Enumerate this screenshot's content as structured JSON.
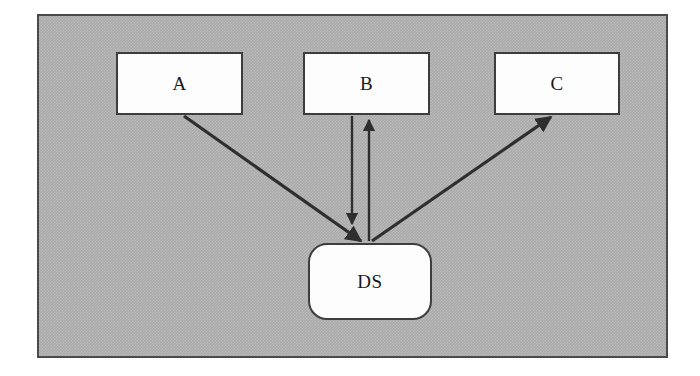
{
  "diagram": {
    "frame": {
      "name": "system-boundary",
      "fill_color": "#a9a9a9",
      "border_color": "#4a4a4a"
    },
    "style": {
      "node_fill": "#fdfdfd",
      "node_border": "#3d3d3d",
      "edge_color": "#2e2e2e",
      "text_color": "#1a1a1a"
    },
    "nodes": [
      {
        "id": "A",
        "label": "A",
        "shape": "rectangle",
        "x": 116,
        "y": 52,
        "width": 127,
        "height": 63
      },
      {
        "id": "B",
        "label": "B",
        "shape": "rectangle",
        "x": 303,
        "y": 52,
        "width": 127,
        "height": 63
      },
      {
        "id": "C",
        "label": "C",
        "shape": "rectangle",
        "x": 494,
        "y": 52,
        "width": 126,
        "height": 63
      },
      {
        "id": "DS",
        "label": "DS",
        "shape": "rounded-rectangle",
        "x": 308,
        "y": 243,
        "width": 124,
        "height": 77
      }
    ],
    "edges": [
      {
        "id": "a-to-ds",
        "from": "A",
        "to": "DS",
        "direction": "one-way",
        "arrowhead_at": "DS"
      },
      {
        "id": "b-to-ds",
        "from": "B",
        "to": "DS",
        "direction": "one-way",
        "arrowhead_at": "DS"
      },
      {
        "id": "ds-to-b",
        "from": "DS",
        "to": "B",
        "direction": "one-way",
        "arrowhead_at": "B"
      },
      {
        "id": "ds-to-c",
        "from": "DS",
        "to": "C",
        "direction": "one-way",
        "arrowhead_at": "C"
      }
    ]
  }
}
